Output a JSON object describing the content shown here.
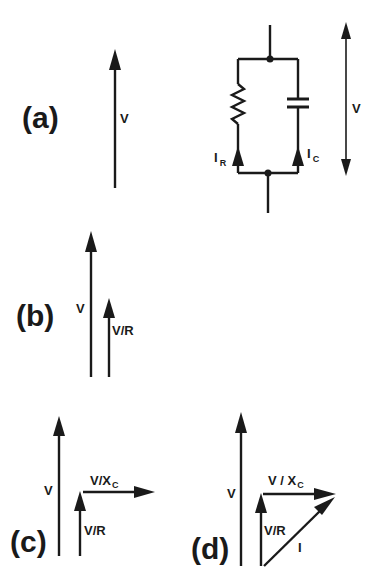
{
  "figure": {
    "type": "phasor-diagram",
    "colors": {
      "ink": "#1a1a1a",
      "background": "#ffffff"
    },
    "panels": [
      {
        "id": "a",
        "label": "(a)",
        "vectors": [
          {
            "name": "V",
            "label": "V",
            "direction": "up"
          }
        ],
        "circuit": {
          "topology": "parallel RC",
          "components": [
            "resistor",
            "capacitor"
          ],
          "currents": [
            {
              "name": "I_R",
              "label": "I",
              "subscript": "R"
            },
            {
              "name": "I_C",
              "label": "I",
              "subscript": "C"
            }
          ],
          "voltage_label": "V"
        }
      },
      {
        "id": "b",
        "label": "(b)",
        "vectors": [
          {
            "name": "V",
            "label": "V",
            "direction": "up"
          },
          {
            "name": "V/R",
            "label": "V/R",
            "direction": "up"
          }
        ]
      },
      {
        "id": "c",
        "label": "(c)",
        "vectors": [
          {
            "name": "V",
            "label": "V",
            "direction": "up"
          },
          {
            "name": "V/R",
            "label": "V/R",
            "direction": "up"
          },
          {
            "name": "V/X_C",
            "label": "V/X",
            "subscript": "C",
            "direction": "right"
          }
        ]
      },
      {
        "id": "d",
        "label": "(d)",
        "vectors": [
          {
            "name": "V",
            "label": "V",
            "direction": "up"
          },
          {
            "name": "V/R",
            "label": "V/R",
            "direction": "up"
          },
          {
            "name": "V/X_C",
            "label": "V / X",
            "subscript": "C",
            "direction": "right"
          },
          {
            "name": "I",
            "label": "I",
            "direction": "diagonal up-right"
          }
        ]
      }
    ]
  }
}
